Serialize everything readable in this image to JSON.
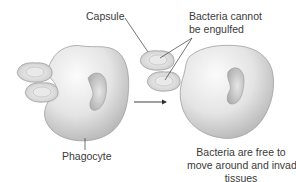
{
  "diagram": {
    "labels": {
      "capsule": "Capsule",
      "bacteria_cannot_line1": "Bacteria cannot",
      "bacteria_cannot_line2": "be engulfed",
      "phagocyte": "Phagocyte",
      "free_line1": "Bacteria are free to",
      "free_line2": "move around and invade",
      "free_line3": "tissues"
    },
    "elements": [
      {
        "name": "phagocyte-left",
        "type": "cell",
        "description": "Phagocyte attempting to engulf encapsulated bacteria"
      },
      {
        "name": "bacterium-left-top",
        "type": "encapsulated-bacterium"
      },
      {
        "name": "bacterium-left-bottom",
        "type": "encapsulated-bacterium"
      },
      {
        "name": "process-arrow",
        "type": "arrow",
        "direction": "right"
      },
      {
        "name": "phagocyte-right",
        "type": "cell"
      },
      {
        "name": "bacterium-right-top",
        "type": "encapsulated-bacterium"
      },
      {
        "name": "bacterium-right-bottom",
        "type": "encapsulated-bacterium"
      }
    ],
    "colors": {
      "background": "#ffffff",
      "cell_fill_light": "#f2f2f2",
      "cell_fill_dark": "#b9b9b9",
      "cell_outline": "#9a9a9a",
      "nucleus": "#c8c8c8",
      "leader_line": "#3a3a3a",
      "text": "#3a3a3a"
    }
  }
}
